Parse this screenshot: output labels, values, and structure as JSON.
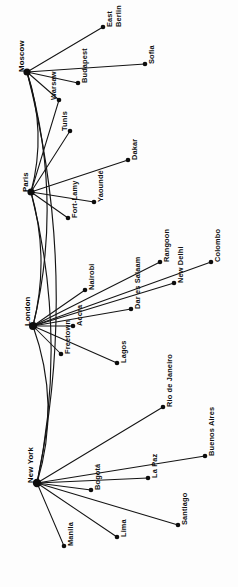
{
  "figure": {
    "name": "international-hub-network-diagram",
    "orientation": "rotated-90-ccw",
    "background_color": "#fdfdfd",
    "line_color": "#141414",
    "node_color": "#0d0d0d"
  },
  "hubs": [
    {
      "id": "moscow",
      "label": "Moscow",
      "x": 27,
      "y": 72,
      "r": 3.6,
      "label_x": 22,
      "label_y": 72
    },
    {
      "id": "paris",
      "label": "Paris",
      "x": 31,
      "y": 192,
      "r": 3.6,
      "label_x": 26,
      "label_y": 192
    },
    {
      "id": "london",
      "label": "London",
      "x": 33,
      "y": 326,
      "r": 4.0,
      "label_x": 28,
      "label_y": 326
    },
    {
      "id": "newyork",
      "label": "New York",
      "x": 37,
      "y": 483,
      "r": 4.2,
      "label_x": 31,
      "label_y": 483
    }
  ],
  "nodes": [
    {
      "id": "east-berlin",
      "label": "East Berlin",
      "label_line_1": "East",
      "label_line_2": "Berlin",
      "x": 103,
      "y": 27,
      "r": 2.3,
      "hub": "moscow",
      "label_x": 110,
      "label_y": 27
    },
    {
      "id": "sofia",
      "label": "Sofia",
      "x": 145,
      "y": 64,
      "r": 2.3,
      "hub": "moscow",
      "label_x": 152,
      "label_y": 64
    },
    {
      "id": "budapest",
      "label": "Budapest",
      "x": 78,
      "y": 83,
      "r": 2.3,
      "hub": "moscow",
      "label_x": 85,
      "label_y": 83
    },
    {
      "id": "warsaw",
      "label": "Warsaw",
      "x": 59,
      "y": 100,
      "r": 2.3,
      "hub": "moscow",
      "label_x": 54,
      "label_y": 100
    },
    {
      "id": "tunis",
      "label": "Tunis",
      "x": 70,
      "y": 131,
      "r": 2.3,
      "hub": "paris",
      "label_x": 65,
      "label_y": 131
    },
    {
      "id": "dakar",
      "label": "Dakar",
      "x": 128,
      "y": 160,
      "r": 2.3,
      "hub": "paris",
      "label_x": 135,
      "label_y": 160
    },
    {
      "id": "yaounde",
      "label": "Yaoundé",
      "x": 94,
      "y": 202,
      "r": 2.3,
      "hub": "paris",
      "label_x": 101,
      "label_y": 202
    },
    {
      "id": "fort-lamy",
      "label": "Fort-Lamy",
      "x": 68,
      "y": 218,
      "r": 2.3,
      "hub": "paris",
      "label_x": 75,
      "label_y": 218
    },
    {
      "id": "rangoon",
      "label": "Rangoon",
      "x": 160,
      "y": 262,
      "r": 2.3,
      "hub": "london",
      "label_x": 167,
      "label_y": 262
    },
    {
      "id": "colombo",
      "label": "Colombo",
      "x": 211,
      "y": 262,
      "r": 2.3,
      "hub": "london",
      "label_x": 218,
      "label_y": 262
    },
    {
      "id": "new-delhi",
      "label": "New Delhi",
      "x": 174,
      "y": 283,
      "r": 2.3,
      "hub": "london",
      "label_x": 181,
      "label_y": 283
    },
    {
      "id": "nairobi",
      "label": "Nairobi",
      "x": 85,
      "y": 290,
      "r": 2.3,
      "hub": "london",
      "label_x": 92,
      "label_y": 290
    },
    {
      "id": "dar-es-salaam",
      "label": "Dar es Salaam",
      "x": 131,
      "y": 309,
      "r": 2.3,
      "hub": "london",
      "label_x": 138,
      "label_y": 309
    },
    {
      "id": "accra",
      "label": "Accra",
      "x": 73,
      "y": 326,
      "r": 2.3,
      "hub": "london",
      "label_x": 80,
      "label_y": 326
    },
    {
      "id": "freetown",
      "label": "Freetown",
      "x": 61,
      "y": 354,
      "r": 2.3,
      "hub": "london",
      "label_x": 68,
      "label_y": 354
    },
    {
      "id": "lagos",
      "label": "Lagos",
      "x": 117,
      "y": 363,
      "r": 2.3,
      "hub": "london",
      "label_x": 124,
      "label_y": 363
    },
    {
      "id": "rio-de-janeiro",
      "label": "Rio de Janeiro",
      "x": 163,
      "y": 407,
      "r": 2.3,
      "hub": "newyork",
      "label_x": 170,
      "label_y": 407
    },
    {
      "id": "buenos-aires",
      "label": "Buenos Aires",
      "x": 205,
      "y": 456,
      "r": 2.3,
      "hub": "newyork",
      "label_x": 212,
      "label_y": 456
    },
    {
      "id": "la-paz",
      "label": "La Paz",
      "x": 148,
      "y": 478,
      "r": 2.3,
      "hub": "newyork",
      "label_x": 155,
      "label_y": 478
    },
    {
      "id": "bogota",
      "label": "Bogotá",
      "x": 91,
      "y": 490,
      "r": 2.3,
      "hub": "newyork",
      "label_x": 98,
      "label_y": 490
    },
    {
      "id": "santiago",
      "label": "Santiago",
      "x": 178,
      "y": 525,
      "r": 2.3,
      "hub": "newyork",
      "label_x": 185,
      "label_y": 525
    },
    {
      "id": "lima",
      "label": "Lima",
      "x": 117,
      "y": 537,
      "r": 2.3,
      "hub": "newyork",
      "label_x": 124,
      "label_y": 537
    },
    {
      "id": "manila",
      "label": "Manila",
      "x": 64,
      "y": 546,
      "r": 2.3,
      "hub": "newyork",
      "label_x": 71,
      "label_y": 546
    }
  ],
  "spoke_edges": [
    {
      "from": "moscow",
      "to": "east-berlin"
    },
    {
      "from": "moscow",
      "to": "sofia"
    },
    {
      "from": "moscow",
      "to": "budapest"
    },
    {
      "from": "moscow",
      "to": "warsaw"
    },
    {
      "from": "paris",
      "to": "tunis"
    },
    {
      "from": "paris",
      "to": "dakar"
    },
    {
      "from": "paris",
      "to": "yaounde"
    },
    {
      "from": "paris",
      "to": "fort-lamy"
    },
    {
      "from": "paris",
      "to": "warsaw"
    },
    {
      "from": "london",
      "to": "rangoon"
    },
    {
      "from": "london",
      "to": "colombo"
    },
    {
      "from": "london",
      "to": "new-delhi"
    },
    {
      "from": "london",
      "to": "nairobi"
    },
    {
      "from": "london",
      "to": "dar-es-salaam"
    },
    {
      "from": "london",
      "to": "accra"
    },
    {
      "from": "london",
      "to": "freetown"
    },
    {
      "from": "london",
      "to": "lagos"
    },
    {
      "from": "newyork",
      "to": "rio-de-janeiro"
    },
    {
      "from": "newyork",
      "to": "buenos-aires"
    },
    {
      "from": "newyork",
      "to": "la-paz"
    },
    {
      "from": "newyork",
      "to": "bogota"
    },
    {
      "from": "newyork",
      "to": "santiago"
    },
    {
      "from": "newyork",
      "to": "lima"
    },
    {
      "from": "newyork",
      "to": "manila"
    }
  ],
  "trunk_edges": [
    {
      "from": "moscow",
      "to": "paris",
      "bulge": 9
    },
    {
      "from": "moscow",
      "to": "london",
      "bulge": 17
    },
    {
      "from": "moscow",
      "to": "newyork",
      "bulge": 24
    },
    {
      "from": "paris",
      "to": "london",
      "bulge": 9
    },
    {
      "from": "paris",
      "to": "newyork",
      "bulge": 17
    },
    {
      "from": "london",
      "to": "newyork",
      "bulge": 13
    }
  ]
}
